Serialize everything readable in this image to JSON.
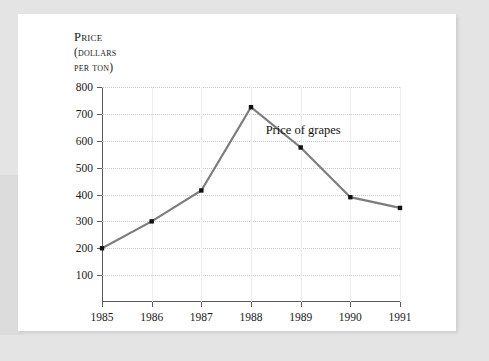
{
  "chart_data": {
    "type": "line",
    "title": "",
    "axis_title_lines": [
      "Price",
      "(dollars",
      "per ton)"
    ],
    "ylabel": "Price (dollars per ton)",
    "xlabel": "",
    "categories": [
      "1985",
      "1986",
      "1987",
      "1988",
      "1989",
      "1990",
      "1991"
    ],
    "x": [
      1985,
      1986,
      1987,
      1988,
      1989,
      1990,
      1991
    ],
    "values": [
      200,
      300,
      415,
      725,
      575,
      390,
      350
    ],
    "series": [
      {
        "name": "Price of grapes",
        "values": [
          200,
          300,
          415,
          725,
          575,
          390,
          350
        ]
      }
    ],
    "ylim": [
      0,
      800
    ],
    "xlim": [
      1985,
      1991
    ],
    "ytick_labels": [
      "100",
      "200",
      "300",
      "400",
      "500",
      "600",
      "700",
      "800"
    ],
    "yticks": [
      100,
      200,
      300,
      400,
      500,
      600,
      700,
      800
    ],
    "xtick_labels": [
      "1985",
      "1986",
      "1987",
      "1988",
      "1989",
      "1990",
      "1991"
    ],
    "annotations": [
      {
        "text": "Price of grapes",
        "x": 1989.05,
        "y": 640
      }
    ],
    "grid": "both",
    "legend": "none",
    "line_color": "#7d7d7d",
    "marker_color": "#111111",
    "marker": "square"
  },
  "colors": {
    "page_background": "#e4e4e4",
    "card_background": "#ffffff",
    "axis": "#5a5a5a",
    "grid_horizontal": "#c9c9c9",
    "grid_vertical": "#ececec",
    "text": "#1a1a1a",
    "line": "#7d7d7d",
    "marker": "#111111"
  }
}
